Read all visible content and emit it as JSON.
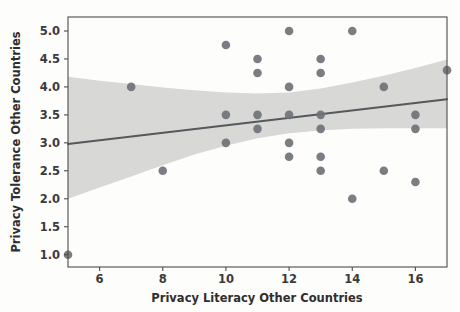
{
  "chart_data": {
    "type": "scatter",
    "title": "",
    "xlabel": "Privacy Literacy Other Countries",
    "ylabel": "Privacy Tolerance Other Countries",
    "xlim": [
      5,
      17
    ],
    "ylim": [
      0.78,
      5.25
    ],
    "xticks": [
      6,
      8,
      10,
      12,
      14,
      16
    ],
    "xticklabels": [
      "6",
      "8",
      "10",
      "12",
      "14",
      "16"
    ],
    "yticks": [
      1.0,
      1.5,
      2.0,
      2.5,
      3.0,
      3.5,
      4.0,
      4.5,
      5.0
    ],
    "yticklabels": [
      "1.0",
      "1.5",
      "2.0",
      "2.5",
      "3.0",
      "3.5",
      "4.0",
      "4.5",
      "5.0"
    ],
    "grid": false,
    "legend": "none",
    "marker_color": "#6f7377",
    "line_color": "#55595c",
    "band_color": "#c9c9c9",
    "points": [
      {
        "x": 5,
        "y": 1.0
      },
      {
        "x": 7,
        "y": 4.0
      },
      {
        "x": 8,
        "y": 2.5
      },
      {
        "x": 10,
        "y": 4.75
      },
      {
        "x": 10,
        "y": 3.5
      },
      {
        "x": 10,
        "y": 3.0
      },
      {
        "x": 11,
        "y": 4.5
      },
      {
        "x": 11,
        "y": 4.25
      },
      {
        "x": 11,
        "y": 3.5
      },
      {
        "x": 11,
        "y": 3.25
      },
      {
        "x": 12,
        "y": 5.0
      },
      {
        "x": 12,
        "y": 4.0
      },
      {
        "x": 12,
        "y": 3.5
      },
      {
        "x": 12,
        "y": 3.0
      },
      {
        "x": 12,
        "y": 2.75
      },
      {
        "x": 13,
        "y": 4.5
      },
      {
        "x": 13,
        "y": 4.25
      },
      {
        "x": 13,
        "y": 3.5
      },
      {
        "x": 13,
        "y": 3.25
      },
      {
        "x": 13,
        "y": 2.75
      },
      {
        "x": 13,
        "y": 2.5
      },
      {
        "x": 14,
        "y": 5.0
      },
      {
        "x": 14,
        "y": 2.0
      },
      {
        "x": 15,
        "y": 4.0
      },
      {
        "x": 15,
        "y": 2.5
      },
      {
        "x": 16,
        "y": 3.5
      },
      {
        "x": 16,
        "y": 3.25
      },
      {
        "x": 16,
        "y": 2.3
      },
      {
        "x": 17,
        "y": 4.3
      }
    ],
    "regression_line": {
      "x": [
        5,
        17
      ],
      "y": [
        2.98,
        3.78
      ]
    },
    "confidence_band": {
      "x": [
        5,
        6,
        7,
        8,
        9,
        10,
        11,
        12,
        13,
        14,
        15,
        16,
        17
      ],
      "upper": [
        4.18,
        4.11,
        4.05,
        3.99,
        3.94,
        3.9,
        3.88,
        3.9,
        3.97,
        4.08,
        4.2,
        4.34,
        4.49
      ],
      "lower": [
        2.0,
        2.2,
        2.4,
        2.6,
        2.79,
        2.95,
        3.08,
        3.17,
        3.22,
        3.25,
        3.26,
        3.26,
        3.26
      ]
    }
  }
}
